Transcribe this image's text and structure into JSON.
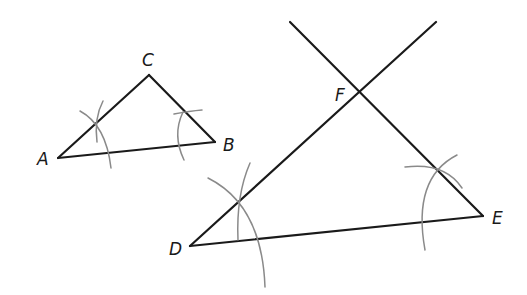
{
  "figure": {
    "colors": {
      "line": "#1a1a1a",
      "arc": "#8a8a8a",
      "background": "#ffffff"
    },
    "small_triangle": {
      "name": "ABC",
      "vertices": {
        "A": {
          "label": "A",
          "x": 58,
          "y": 158
        },
        "B": {
          "label": "B",
          "x": 215,
          "y": 142
        },
        "C": {
          "label": "C",
          "x": 149,
          "y": 75
        }
      }
    },
    "large_triangle": {
      "name": "DEF",
      "vertices": {
        "D": {
          "label": "D",
          "x": 190,
          "y": 246
        },
        "E": {
          "label": "E",
          "x": 483,
          "y": 216
        },
        "F": {
          "label": "F",
          "x": 359,
          "y": 92
        }
      },
      "extended_rays": [
        {
          "from": "D",
          "through": "F",
          "end_x": 436,
          "end_y": 22
        },
        {
          "from": "E",
          "through": "F",
          "end_x": 290,
          "end_y": 22
        }
      ]
    },
    "labels": {
      "A": "A",
      "B": "B",
      "C": "C",
      "D": "D",
      "E": "E",
      "F": "F"
    }
  }
}
